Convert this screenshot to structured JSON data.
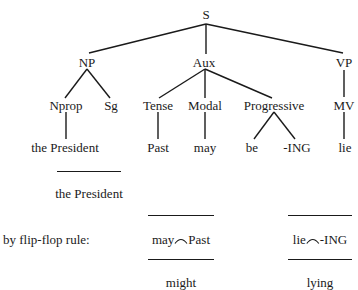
{
  "tree": {
    "root": "S",
    "level1": {
      "np": "NP",
      "aux": "Aux",
      "vp": "VP"
    },
    "level2": {
      "nprop": "Nprop",
      "sg": "Sg",
      "tense": "Tense",
      "modal": "Modal",
      "progressive": "Progressive",
      "mv": "MV"
    },
    "leaves": {
      "the_president": "the President",
      "past": "Past",
      "may": "may",
      "be": "be",
      "ing": "-ING",
      "lie": "lie"
    }
  },
  "derivation": {
    "subject_result": "the President",
    "rule_label": "by flip-flop rule:",
    "modal_join": {
      "left": "may",
      "right": "Past",
      "result": "might"
    },
    "verb_join": {
      "left": "lie",
      "right": "-ING",
      "result": "lying"
    }
  },
  "colors": {
    "ink": "#1a1a1a",
    "background": "#ffffff"
  }
}
